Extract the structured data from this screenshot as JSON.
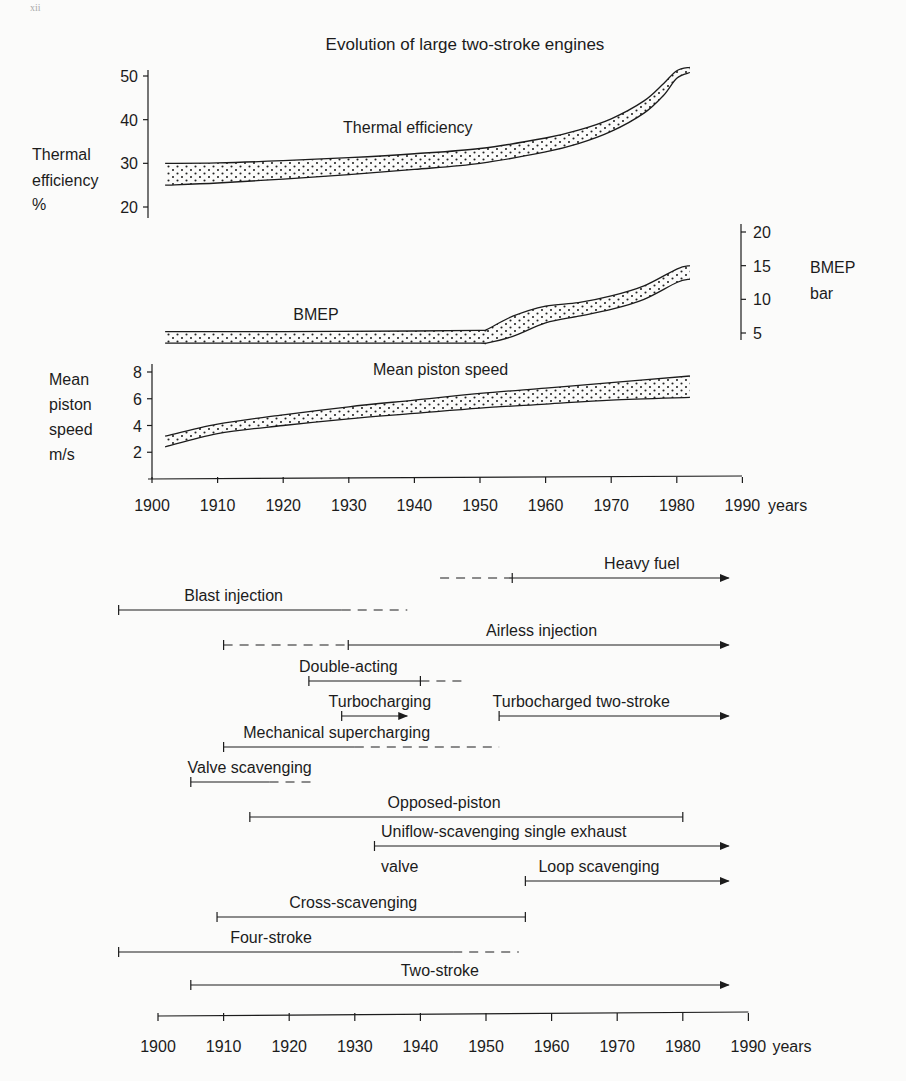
{
  "page": {
    "marker": "xii"
  },
  "chart_data": [
    {
      "type": "area",
      "title": "Evolution of large two-stroke engines",
      "xlabel": "years",
      "x_ticks": [
        1900,
        1910,
        1920,
        1930,
        1940,
        1950,
        1960,
        1970,
        1980,
        1990
      ],
      "series": [
        {
          "name": "Thermal efficiency",
          "axis_label": [
            "Thermal",
            "efficiency",
            "%"
          ],
          "y_ticks": [
            20,
            30,
            40,
            50
          ],
          "ylim": [
            20,
            51
          ],
          "x": [
            1902,
            1910,
            1920,
            1930,
            1940,
            1950,
            1960,
            1965,
            1970,
            1975,
            1978,
            1980,
            1982
          ],
          "upper": [
            30,
            30.1,
            30.6,
            31.3,
            32.2,
            33.4,
            35.8,
            37.6,
            40.2,
            44.3,
            48.3,
            51.2,
            52
          ],
          "lower": [
            25,
            25.5,
            26.4,
            27.4,
            28.6,
            30,
            32.6,
            34.5,
            37.3,
            41.5,
            45.6,
            49.5,
            50.8
          ],
          "label_pos": [
            1939,
            37
          ]
        },
        {
          "name": "BMEP",
          "axis_label": [
            "BMEP",
            "bar"
          ],
          "y_ticks": [
            5,
            10,
            15,
            20
          ],
          "ylim": [
            4,
            20
          ],
          "x": [
            1902,
            1920,
            1940,
            1950,
            1951,
            1955,
            1960,
            1965,
            1970,
            1975,
            1980,
            1982
          ],
          "upper": [
            5.2,
            5.2,
            5.3,
            5.4,
            5.5,
            7.5,
            9,
            9.5,
            10.5,
            12,
            14.5,
            15
          ],
          "lower": [
            3.5,
            3.5,
            3.5,
            3.5,
            3.5,
            4.5,
            6.5,
            7.5,
            8.5,
            10,
            12.5,
            13
          ],
          "label_pos": [
            1925,
            7
          ]
        },
        {
          "name": "Mean piston speed",
          "axis_label": [
            "Mean",
            "piston",
            "speed",
            "m/s"
          ],
          "y_ticks": [
            2,
            4,
            6,
            8
          ],
          "ylim": [
            0,
            8.5
          ],
          "x": [
            1902,
            1910,
            1920,
            1930,
            1940,
            1950,
            1960,
            1970,
            1982
          ],
          "upper": [
            3.2,
            4.1,
            4.8,
            5.4,
            5.9,
            6.4,
            6.8,
            7.2,
            7.7
          ],
          "lower": [
            2.4,
            3.4,
            4.0,
            4.5,
            4.9,
            5.3,
            5.6,
            5.9,
            6.1
          ],
          "label_pos": [
            1944,
            7.8
          ]
        }
      ]
    },
    {
      "type": "timeline",
      "xlabel": "years",
      "x_ticks": [
        1900,
        1910,
        1920,
        1930,
        1940,
        1950,
        1960,
        1970,
        1980,
        1990
      ],
      "xlim": [
        1900,
        1990
      ],
      "items": [
        {
          "label": "Heavy fuel",
          "segments": [
            {
              "from": 1943,
              "to": 1954,
              "style": "dashed"
            },
            {
              "from": 1954,
              "to": 1987,
              "style": "solid"
            }
          ],
          "start_tick": false,
          "mid_tick": 1954,
          "arrow": true,
          "label_x": 1968
        },
        {
          "label": "Blast injection",
          "segments": [
            {
              "from": 1894,
              "to": 1928,
              "style": "solid"
            },
            {
              "from": 1928,
              "to": 1938,
              "style": "dashed"
            }
          ],
          "start_tick": true,
          "arrow": false,
          "label_x": 1904
        },
        {
          "label": "Airless injection",
          "segments": [
            {
              "from": 1910,
              "to": 1929,
              "style": "dashed"
            },
            {
              "from": 1929,
              "to": 1987,
              "style": "solid"
            }
          ],
          "start_tick": true,
          "mid_tick": 1929,
          "arrow": true,
          "label_x": 1950
        },
        {
          "label": "Double-acting",
          "segments": [
            {
              "from": 1923,
              "to": 1940,
              "style": "solid"
            },
            {
              "from": 1940,
              "to": 1947,
              "style": "dashed"
            }
          ],
          "start_tick": true,
          "mid_tick": 1940,
          "arrow": false,
          "label_x": 1921.5
        },
        {
          "label": "Turbocharging",
          "segments": [
            {
              "from": 1928,
              "to": 1938,
              "style": "solid"
            }
          ],
          "start_tick": true,
          "arrow": true,
          "label_x": 1926
        },
        {
          "label": "Turbocharged two-stroke",
          "segments": [
            {
              "from": 1952,
              "to": 1987,
              "style": "solid"
            }
          ],
          "start_tick": true,
          "arrow": true,
          "label_x": 1951
        },
        {
          "label": "Mechanical supercharging",
          "segments": [
            {
              "from": 1910,
              "to": 1930,
              "style": "solid"
            },
            {
              "from": 1930,
              "to": 1952,
              "style": "dashed"
            }
          ],
          "start_tick": true,
          "arrow": false,
          "label_x": 1913
        },
        {
          "label": "Valve scavenging",
          "segments": [
            {
              "from": 1905,
              "to": 1917,
              "style": "solid"
            },
            {
              "from": 1917,
              "to": 1924,
              "style": "dashed"
            }
          ],
          "start_tick": true,
          "arrow": false,
          "label_x": 1904.5
        },
        {
          "label": "Opposed-piston",
          "segments": [
            {
              "from": 1914,
              "to": 1980,
              "style": "solid"
            }
          ],
          "start_tick": true,
          "end_tick": true,
          "arrow": false,
          "label_x": 1935
        },
        {
          "label": "Uniflow-scavenging single exhaust",
          "label2": "valve",
          "segments": [
            {
              "from": 1933,
              "to": 1987,
              "style": "solid"
            }
          ],
          "start_tick": true,
          "arrow": true,
          "label_x": 1934
        },
        {
          "label": "Loop scavenging",
          "segments": [
            {
              "from": 1956,
              "to": 1987,
              "style": "solid"
            }
          ],
          "start_tick": true,
          "arrow": true,
          "label_x": 1958
        },
        {
          "label": "Cross-scavenging",
          "segments": [
            {
              "from": 1909,
              "to": 1956,
              "style": "solid"
            }
          ],
          "start_tick": true,
          "end_tick": true,
          "arrow": false,
          "label_x": 1920
        },
        {
          "label": "Four-stroke",
          "segments": [
            {
              "from": 1894,
              "to": 1945,
              "style": "solid"
            },
            {
              "from": 1945,
              "to": 1955,
              "style": "dashed"
            }
          ],
          "start_tick": true,
          "arrow": false,
          "label_x": 1911
        },
        {
          "label": "Two-stroke",
          "segments": [
            {
              "from": 1905,
              "to": 1987,
              "style": "solid"
            }
          ],
          "start_tick": true,
          "arrow": true,
          "label_x": 1937
        }
      ]
    }
  ]
}
